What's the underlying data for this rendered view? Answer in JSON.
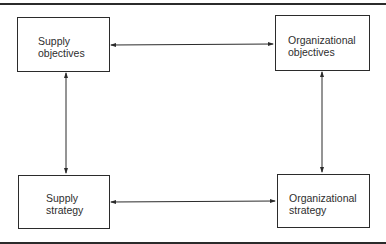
{
  "diagram": {
    "nodes": [
      {
        "id": "supply_objectives",
        "label_line1": "Supply",
        "label_line2": "objectives"
      },
      {
        "id": "organizational_objectives",
        "label_line1": "Organizational",
        "label_line2": "objectives"
      },
      {
        "id": "supply_strategy",
        "label_line1": "Supply",
        "label_line2": "strategy"
      },
      {
        "id": "organizational_strategy",
        "label_line1": "Organizational",
        "label_line2": "strategy"
      }
    ],
    "edges": [
      {
        "from": "supply_objectives",
        "to": "organizational_objectives",
        "direction": "bidirectional"
      },
      {
        "from": "supply_objectives",
        "to": "supply_strategy",
        "direction": "bidirectional"
      },
      {
        "from": "organizational_objectives",
        "to": "organizational_strategy",
        "direction": "bidirectional"
      },
      {
        "from": "supply_strategy",
        "to": "organizational_strategy",
        "direction": "bidirectional"
      }
    ],
    "colors": {
      "line": "#2b2b2b",
      "background": "#ffffff"
    }
  }
}
